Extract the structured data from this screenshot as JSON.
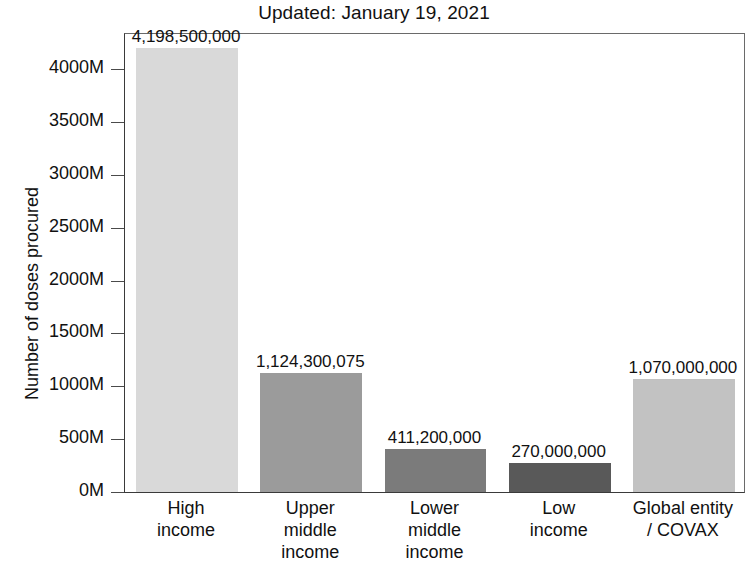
{
  "chart_data": {
    "type": "bar",
    "title": "Updated: January 19, 2021",
    "xlabel": "",
    "ylabel": "Number of doses procured",
    "categories": [
      "High income",
      "Upper middle income",
      "Lower middle income",
      "Low income",
      "Global entity / COVAX"
    ],
    "category_lines": [
      [
        "High",
        "income"
      ],
      [
        "Upper",
        "middle",
        "income"
      ],
      [
        "Lower",
        "middle",
        "income"
      ],
      [
        "Low",
        "income"
      ],
      [
        "Global entity",
        "/ COVAX"
      ]
    ],
    "values": [
      4198500000,
      1124300075,
      411200000,
      270000000,
      1070000000
    ],
    "value_labels": [
      "4,198,500,000",
      "1,124,300,075",
      "411,200,000",
      "270,000,000",
      "1,070,000,000"
    ],
    "bar_colors": [
      "#d9d9d9",
      "#9b9b9b",
      "#7b7b7b",
      "#595959",
      "#c2c2c2"
    ],
    "ylim": [
      0,
      4350000000
    ],
    "ytick_values": [
      0,
      500000000,
      1000000000,
      1500000000,
      2000000000,
      2500000000,
      3000000000,
      3500000000,
      4000000000
    ],
    "ytick_labels": [
      "0M",
      "500M",
      "1000M",
      "1500M",
      "2000M",
      "2500M",
      "3000M",
      "3500M",
      "4000M"
    ],
    "grid": false,
    "legend": "none"
  }
}
